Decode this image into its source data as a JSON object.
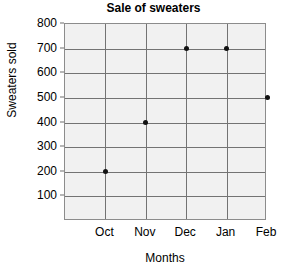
{
  "chart_data": {
    "type": "scatter",
    "title": "Sale of sweaters",
    "xlabel": "Months",
    "ylabel": "Sweaters sold",
    "categories": [
      "Oct",
      "Nov",
      "Dec",
      "Jan",
      "Feb"
    ],
    "values": [
      200,
      400,
      700,
      700,
      500
    ],
    "points": [
      {
        "x": "Oct",
        "y": 200
      },
      {
        "x": "Nov",
        "y": 400
      },
      {
        "x": "Dec",
        "y": 700
      },
      {
        "x": "Jan",
        "y": 700
      },
      {
        "x": "Feb",
        "y": 500
      }
    ],
    "yticks": [
      800,
      700,
      600,
      500,
      400,
      300,
      200,
      100
    ],
    "ylim": [
      0,
      800
    ],
    "grid": true,
    "legend": false,
    "marker_color": "#111111",
    "plot_background_color": "#f1f1f1",
    "gridline_color": "#737373",
    "axis_color": "#8c8c8c"
  }
}
